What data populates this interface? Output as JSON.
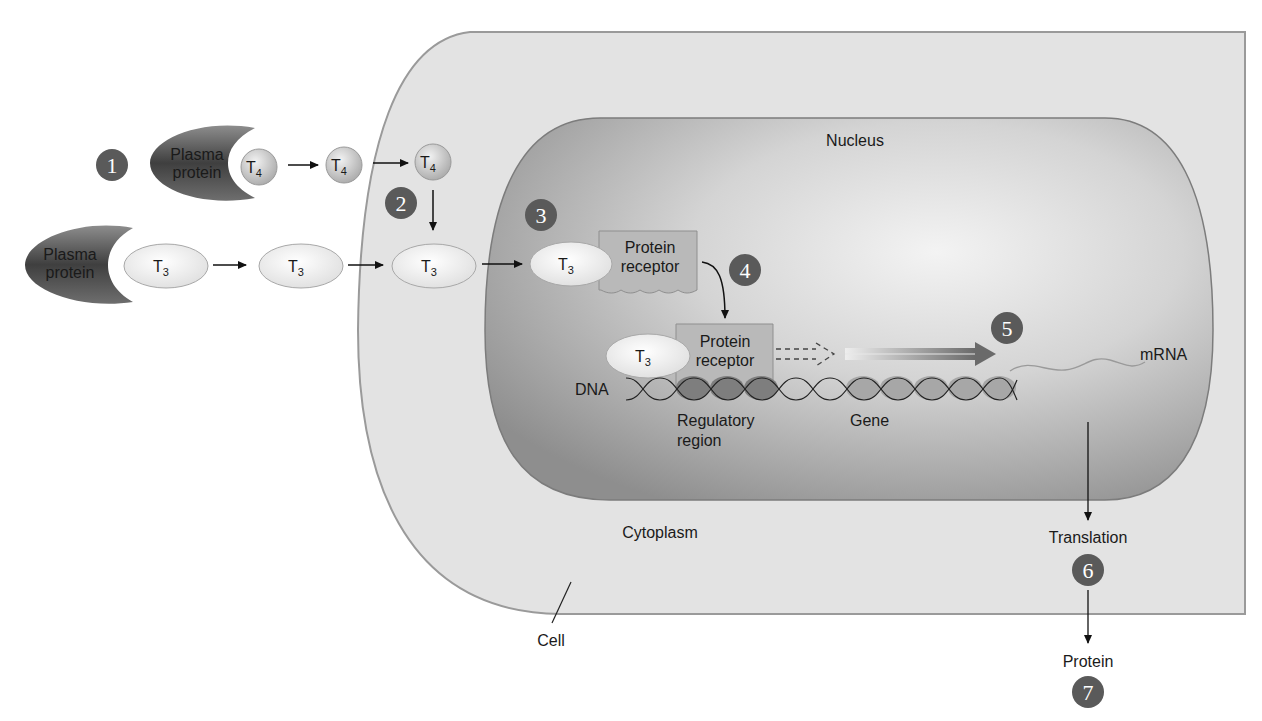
{
  "diagram": {
    "type": "thyroid-hormone-cellular-mechanism",
    "regions": {
      "cell_label": "Cell",
      "cytoplasm_label": "Cytoplasm",
      "nucleus_label": "Nucleus"
    },
    "molecules": {
      "plasma_protein_line1": "Plasma",
      "plasma_protein_line2": "protein",
      "t4_base": "T",
      "t4_sub": "4",
      "t3_base": "T",
      "t3_sub": "3",
      "receptor_line1": "Protein",
      "receptor_line2": "receptor"
    },
    "dna": {
      "label": "DNA",
      "regulatory_line1": "Regulatory",
      "regulatory_line2": "region",
      "gene_label": "Gene",
      "mrna_label": "mRNA"
    },
    "outputs": {
      "translation_label": "Translation",
      "protein_label": "Protein"
    },
    "steps": [
      "1",
      "2",
      "3",
      "4",
      "5",
      "6",
      "7"
    ],
    "colors": {
      "cell_fill": "#e3e3e3",
      "cell_border": "#9a9a9a",
      "nucleus_dark": "#8c8c8c",
      "nucleus_light": "#efefef",
      "step_badge": "#5a5a5a",
      "receptor_fill": "#b9b9b9",
      "plasma_protein_dark": "#4a4a4a",
      "t3_fill": "#f4f4f4",
      "t4_fill": "#c8c8c8",
      "regulatory_bead": "#7e7e7e",
      "gene_bead": "#a7a7a7"
    }
  }
}
